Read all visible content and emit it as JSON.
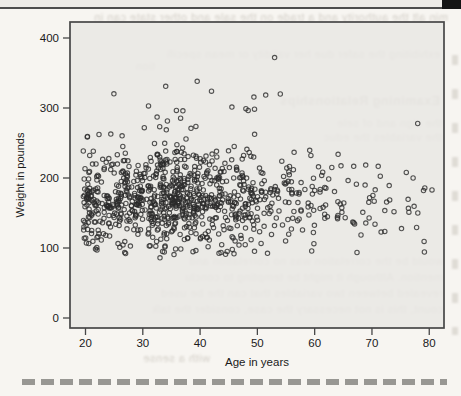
{
  "page": {
    "background": "#f7f5f1"
  },
  "header_rule": {
    "bar_color": "#edebe7",
    "edge_color": "#4d4d4d",
    "corner_block_color": "#141414"
  },
  "divider": {
    "color": "#8e8d89"
  },
  "bleedthrough": {
    "color": "#b5afa5",
    "lines": [
      {
        "text": "min alt the authority and a trade on the sale and other state can in"
      },
      {
        "text": "exhibiting the safer due her validity or mean specifi"
      },
      {
        "text": "tion"
      },
      {
        "text": "Examining Relationships"
      },
      {
        "text": "the sign and of sele"
      },
      {
        "text": "the variables the educ"
      },
      {
        "text": "would be the correlation was no correlation and"
      },
      {
        "text": "mention. Although it might be tempting to conclu"
      },
      {
        "text": "revealed between two variables that can the be used"
      },
      {
        "text": "count, this is not necessary the case, consider the talk"
      },
      {
        "text": "with a sense"
      }
    ]
  },
  "chart_data": {
    "type": "scatter",
    "title": "",
    "xlabel": "Age in years",
    "ylabel": "Weight in pounds",
    "xlim": [
      17.3,
      82.6
    ],
    "ylim": [
      -14,
      423
    ],
    "x_ticks": [
      20,
      30,
      40,
      50,
      60,
      70,
      80
    ],
    "y_ticks": [
      0,
      100,
      200,
      300,
      400
    ],
    "grid": false,
    "legend": null,
    "marker": {
      "shape": "open-circle",
      "radius": 2.2,
      "color": "#2b2b2b"
    },
    "panel_color": "#e9e8e4",
    "frame_color": "#474747",
    "tick_label_color": "#1a1a1a",
    "n_points": 950,
    "distribution": {
      "seed": 7,
      "age": {
        "mode": 38,
        "sd": 11.5,
        "right_skew": 2.6,
        "min": 19.6,
        "max": 80.5
      },
      "weight": {
        "components": [
          {
            "p": 0.9,
            "mean": 168,
            "sd": 33
          },
          {
            "p": 0.1,
            "mean": 205,
            "sd": 52
          }
        ],
        "min": 86,
        "max": 345,
        "older_age_start": 62,
        "older_age_slope": -0.7
      }
    },
    "outlier_points": [
      [
        53,
        372
      ],
      [
        34,
        331
      ],
      [
        42,
        324
      ],
      [
        54,
        320
      ],
      [
        31,
        303
      ],
      [
        48,
        299
      ],
      [
        37,
        296
      ],
      [
        27,
        92
      ],
      [
        33,
        86
      ],
      [
        22,
        97
      ],
      [
        76,
        208
      ],
      [
        78,
        150
      ],
      [
        79,
        182
      ]
    ]
  }
}
